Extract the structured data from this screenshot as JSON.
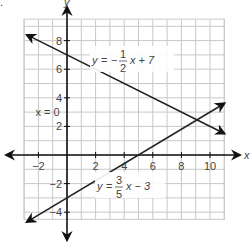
{
  "corner_mark": ".",
  "chart_data": {
    "type": "line",
    "title": "",
    "xlabel": "x",
    "ylabel": "y",
    "xlim": [
      -3,
      11
    ],
    "ylim": [
      -4.5,
      9.5
    ],
    "grid": true,
    "x_ticks": [
      -2,
      2,
      4,
      6,
      8,
      10
    ],
    "y_ticks": [
      8,
      6,
      4,
      2,
      -2,
      -4
    ],
    "series": [
      {
        "name": "y = -1/2 x + 7",
        "label_parts": {
          "lhs": "y",
          "eq": "=",
          "sign": "−",
          "num": "1",
          "den": "2",
          "rest": "x + 7"
        },
        "slope": -0.5,
        "intercept": 7,
        "x_range": [
          -2.8,
          11
        ],
        "arrows": "both",
        "color": "#222222"
      },
      {
        "name": "y = 3/5 x - 3",
        "label_parts": {
          "lhs": "y",
          "eq": "=",
          "sign": "",
          "num": "3",
          "den": "5",
          "rest": "x − 3"
        },
        "slope": 0.6,
        "intercept": -3,
        "x_range": [
          -2.8,
          11
        ],
        "arrows": "both",
        "color": "#222222"
      }
    ],
    "annotations": [
      {
        "text": "x = 0",
        "x": -2.2,
        "y": 3
      }
    ]
  }
}
